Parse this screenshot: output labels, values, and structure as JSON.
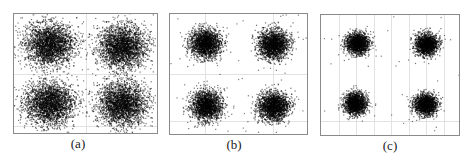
{
  "figure": {
    "frame_color": "#8a8a8a",
    "grid_color": "#e2e2e2",
    "point_color": "#000000"
  },
  "chart_data": [
    {
      "type": "scatter",
      "title": "",
      "caption": "(a)",
      "xlabel": "",
      "ylabel": "",
      "grid": true,
      "legend": null,
      "clusters": [
        {
          "quadrant": "top-left",
          "cx": -1,
          "cy": 1,
          "spread": "large"
        },
        {
          "quadrant": "top-right",
          "cx": 1,
          "cy": 1,
          "spread": "large"
        },
        {
          "quadrant": "bottom-left",
          "cx": -1,
          "cy": -1,
          "spread": "large"
        },
        {
          "quadrant": "bottom-right",
          "cx": 1,
          "cy": -1,
          "spread": "large"
        }
      ],
      "relative_sigma": 0.32
    },
    {
      "type": "scatter",
      "title": "",
      "caption": "(b)",
      "xlabel": "",
      "ylabel": "",
      "grid": true,
      "legend": null,
      "clusters": [
        {
          "quadrant": "top-left",
          "cx": -1,
          "cy": 1,
          "spread": "medium"
        },
        {
          "quadrant": "top-right",
          "cx": 1,
          "cy": 1,
          "spread": "medium"
        },
        {
          "quadrant": "bottom-left",
          "cx": -1,
          "cy": -1,
          "spread": "medium"
        },
        {
          "quadrant": "bottom-right",
          "cx": 1,
          "cy": -1,
          "spread": "medium"
        }
      ],
      "relative_sigma": 0.22
    },
    {
      "type": "scatter",
      "title": "",
      "caption": "(c)",
      "xlabel": "",
      "ylabel": "",
      "grid": true,
      "legend": null,
      "clusters": [
        {
          "quadrant": "top-left",
          "cx": -1,
          "cy": 1,
          "spread": "small"
        },
        {
          "quadrant": "top-right",
          "cx": 1,
          "cy": 1,
          "spread": "small"
        },
        {
          "quadrant": "bottom-left",
          "cx": -1,
          "cy": -1,
          "spread": "small"
        },
        {
          "quadrant": "bottom-right",
          "cx": 1,
          "cy": -1,
          "spread": "small"
        }
      ],
      "relative_sigma": 0.17
    }
  ],
  "panels": [
    {
      "caption": "(a)"
    },
    {
      "caption": "(b)"
    },
    {
      "caption": "(c)"
    }
  ]
}
